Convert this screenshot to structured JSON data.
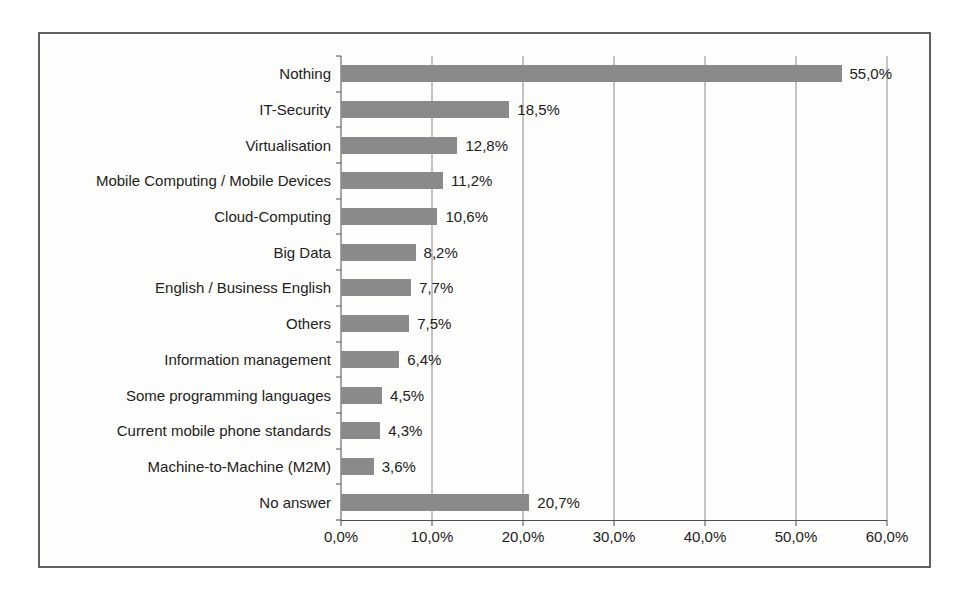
{
  "chart_data": {
    "type": "bar",
    "orientation": "horizontal",
    "categories": [
      "Nothing",
      "IT-Security",
      "Virtualisation",
      "Mobile Computing / Mobile Devices",
      "Cloud-Computing",
      "Big Data",
      "English / Business English",
      "Others",
      "Information management",
      "Some programming languages",
      "Current mobile phone standards",
      "Machine-to-Machine (M2M)",
      "No answer"
    ],
    "values": [
      55.0,
      18.5,
      12.8,
      11.2,
      10.6,
      8.2,
      7.7,
      7.5,
      6.4,
      4.5,
      4.3,
      3.6,
      20.7
    ],
    "value_labels": [
      "55,0%",
      "18,5%",
      "12,8%",
      "11,2%",
      "10,6%",
      "8,2%",
      "7,7%",
      "7,5%",
      "6,4%",
      "4,5%",
      "4,3%",
      "3,6%",
      "20,7%"
    ],
    "x_ticks": [
      "0,0%",
      "10,0%",
      "20,0%",
      "30,0%",
      "40,0%",
      "50,0%",
      "60,0%"
    ],
    "x_tick_values": [
      0,
      10,
      20,
      30,
      40,
      50,
      60
    ],
    "xlim": [
      0,
      60
    ],
    "grid": "vertical",
    "legend": "none",
    "decimal_separator": ",",
    "bar_color": "#8a8a8a"
  }
}
